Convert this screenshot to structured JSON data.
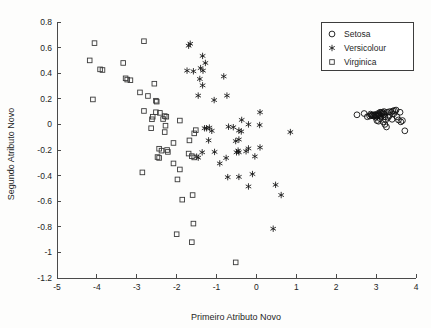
{
  "chart_data": {
    "type": "scatter",
    "title": "",
    "xlabel": "Primeiro Atributo Novo",
    "ylabel": "Segundo Atributo Novo",
    "xlim": [
      -5,
      4
    ],
    "ylim": [
      -1.2,
      0.8
    ],
    "xticks": [
      "-5",
      "-4",
      "-3",
      "-2",
      "-1",
      "0",
      "1",
      "2",
      "3",
      "4"
    ],
    "xtick_values": [
      -5,
      -4,
      -3,
      -2,
      -1,
      0,
      1,
      2,
      3,
      4
    ],
    "yticks": [
      "0.8",
      "0.6",
      "0.4",
      "0.2",
      "0",
      "-0.2",
      "-0.4",
      "-0.6",
      "-0.8",
      "-1",
      "-1.2"
    ],
    "ytick_values": [
      0.8,
      0.6,
      0.4,
      0.2,
      0,
      -0.2,
      -0.4,
      -0.6,
      -0.8,
      -1.0,
      -1.2
    ],
    "grid": false,
    "legend_position": "top-right",
    "series": [
      {
        "name": "Setosa",
        "marker": "circle",
        "color": "#111111",
        "points": [
          [
            2.52,
            0.075
          ],
          [
            2.7,
            0.085
          ],
          [
            2.78,
            0.06
          ],
          [
            2.84,
            0.065
          ],
          [
            2.86,
            0.08
          ],
          [
            2.88,
            0.072
          ],
          [
            2.9,
            0.068
          ],
          [
            2.92,
            0.074
          ],
          [
            2.94,
            0.066
          ],
          [
            2.96,
            0.07
          ],
          [
            2.98,
            0.078
          ],
          [
            3.0,
            0.072
          ],
          [
            3.02,
            0.064
          ],
          [
            3.04,
            0.07
          ],
          [
            3.06,
            0.076
          ],
          [
            3.08,
            0.07
          ],
          [
            3.02,
            0.03
          ],
          [
            3.06,
            0.025
          ],
          [
            3.1,
            0.095
          ],
          [
            3.12,
            0.09
          ],
          [
            3.14,
            0.082
          ],
          [
            3.16,
            0.095
          ],
          [
            3.18,
            0.088
          ],
          [
            3.2,
            0.1
          ],
          [
            3.22,
            0.06
          ],
          [
            3.24,
            0.035
          ],
          [
            3.22,
            0.0
          ],
          [
            3.26,
            -0.02
          ],
          [
            3.28,
            0.095
          ],
          [
            3.34,
            0.1
          ],
          [
            3.38,
            0.095
          ],
          [
            3.42,
            0.105
          ],
          [
            3.46,
            0.108
          ],
          [
            3.5,
            0.112
          ],
          [
            3.52,
            0.06
          ],
          [
            3.56,
            0.035
          ],
          [
            3.6,
            0.095
          ],
          [
            3.62,
            0.02
          ],
          [
            3.66,
            0.03
          ],
          [
            3.72,
            -0.05
          ],
          [
            3.4,
            0.04
          ],
          [
            3.3,
            0.055
          ],
          [
            3.18,
            0.02
          ],
          [
            3.1,
            0.045
          ],
          [
            2.99,
            0.055
          ],
          [
            3.05,
            0.085
          ],
          [
            3.12,
            0.065
          ],
          [
            3.2,
            0.078
          ],
          [
            3.34,
            0.07
          ],
          [
            3.44,
            0.082
          ]
        ]
      },
      {
        "name": "Versicolour",
        "marker": "star",
        "color": "#111111",
        "points": [
          [
            -1.7,
            0.615
          ],
          [
            -1.66,
            0.63
          ],
          [
            -1.35,
            0.535
          ],
          [
            -1.28,
            0.48
          ],
          [
            -1.4,
            0.44
          ],
          [
            -1.34,
            0.42
          ],
          [
            -1.74,
            0.42
          ],
          [
            -1.58,
            0.415
          ],
          [
            -0.82,
            0.375
          ],
          [
            -1.42,
            0.355
          ],
          [
            -1.35,
            0.305
          ],
          [
            -1.46,
            0.225
          ],
          [
            -0.74,
            0.225
          ],
          [
            -1.06,
            0.19
          ],
          [
            0.09,
            0.095
          ],
          [
            -0.37,
            0.035
          ],
          [
            -0.2,
            0.0
          ],
          [
            0.08,
            -0.005
          ],
          [
            -1.18,
            -0.025
          ],
          [
            -1.25,
            -0.03
          ],
          [
            -0.7,
            -0.018
          ],
          [
            -1.12,
            -0.05
          ],
          [
            -0.44,
            -0.048
          ],
          [
            -0.38,
            -0.055
          ],
          [
            -1.2,
            -0.125
          ],
          [
            -0.44,
            -0.118
          ],
          [
            0.85,
            -0.06
          ],
          [
            -1.36,
            -0.218
          ],
          [
            -1.05,
            -0.215
          ],
          [
            -0.46,
            -0.205
          ],
          [
            -0.44,
            -0.218
          ],
          [
            -0.2,
            -0.188
          ],
          [
            0.09,
            -0.18
          ],
          [
            -1.5,
            -0.252
          ],
          [
            -1.46,
            -0.26
          ],
          [
            -0.76,
            -0.262
          ],
          [
            -0.04,
            -0.25
          ],
          [
            -0.92,
            -0.305
          ],
          [
            -0.72,
            -0.412
          ],
          [
            -0.44,
            -0.41
          ],
          [
            -0.1,
            -0.388
          ],
          [
            -0.2,
            -0.485
          ],
          [
            0.48,
            -0.472
          ],
          [
            0.62,
            -0.552
          ],
          [
            0.42,
            -0.815
          ],
          [
            -1.3,
            -0.03
          ],
          [
            -0.58,
            -0.022
          ],
          [
            -0.52,
            -0.13
          ],
          [
            -0.5,
            -0.218
          ],
          [
            -0.26,
            -0.21
          ]
        ]
      },
      {
        "name": "Virginica",
        "marker": "square",
        "color": "#3a3a3a",
        "points": [
          [
            -4.06,
            0.635
          ],
          [
            -2.82,
            0.65
          ],
          [
            -4.18,
            0.5
          ],
          [
            -3.92,
            0.43
          ],
          [
            -3.86,
            0.425
          ],
          [
            -3.34,
            0.48
          ],
          [
            -3.28,
            0.36
          ],
          [
            -3.24,
            0.35
          ],
          [
            -3.16,
            0.345
          ],
          [
            -2.56,
            0.318
          ],
          [
            -2.92,
            0.25
          ],
          [
            -2.72,
            0.222
          ],
          [
            -4.1,
            0.195
          ],
          [
            -2.52,
            0.185
          ],
          [
            -2.5,
            0.178
          ],
          [
            -2.82,
            0.105
          ],
          [
            -2.6,
            0.06
          ],
          [
            -2.62,
            0.04
          ],
          [
            -2.52,
            0.095
          ],
          [
            -2.42,
            0.09
          ],
          [
            -2.3,
            0.065
          ],
          [
            -2.26,
            0.06
          ],
          [
            -1.92,
            0.03
          ],
          [
            -2.64,
            -0.03
          ],
          [
            -2.28,
            -0.01
          ],
          [
            -2.3,
            -0.06
          ],
          [
            -1.52,
            -0.045
          ],
          [
            -1.56,
            -0.07
          ],
          [
            -2.08,
            -0.145
          ],
          [
            -1.68,
            -0.125
          ],
          [
            -2.44,
            -0.19
          ],
          [
            -2.38,
            -0.205
          ],
          [
            -2.24,
            -0.2
          ],
          [
            -2.22,
            -0.215
          ],
          [
            -2.48,
            -0.255
          ],
          [
            -2.44,
            -0.262
          ],
          [
            -1.62,
            -0.248
          ],
          [
            -1.56,
            -0.258
          ],
          [
            -1.7,
            -0.228
          ],
          [
            -2.08,
            -0.305
          ],
          [
            -2.86,
            -0.375
          ],
          [
            -1.92,
            -0.352
          ],
          [
            -1.98,
            -0.43
          ],
          [
            -1.86,
            -0.588
          ],
          [
            -1.6,
            -0.552
          ],
          [
            -1.58,
            -0.775
          ],
          [
            -2.0,
            -0.858
          ],
          [
            -1.62,
            -0.92
          ],
          [
            -0.52,
            -1.078
          ],
          [
            -2.34,
            0.042
          ]
        ]
      }
    ]
  },
  "legend": {
    "items": [
      {
        "label": "Setosa",
        "marker": "circle"
      },
      {
        "label": "Versicolour",
        "marker": "star"
      },
      {
        "label": "Virginica",
        "marker": "square"
      }
    ]
  }
}
